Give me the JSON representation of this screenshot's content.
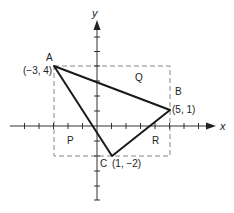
{
  "diagram": {
    "axes": {
      "x_label": "x",
      "y_label": "y",
      "unit_px": 14.5,
      "origin_px": [
        97,
        126
      ]
    },
    "points": [
      {
        "name": "A",
        "coord_label": "(−3, 4)",
        "x": -3,
        "y": 4
      },
      {
        "name": "B",
        "coord_label": "(5, 1)",
        "x": 5,
        "y": 1
      },
      {
        "name": "C",
        "coord_label": "(1, −2)",
        "x": 1,
        "y": -2
      }
    ],
    "regions": [
      {
        "name": "P"
      },
      {
        "name": "Q"
      },
      {
        "name": "R"
      }
    ],
    "bounding_rectangle": {
      "x_min": -3,
      "x_max": 5,
      "y_min": -2,
      "y_max": 4,
      "style": "dashed"
    },
    "colors": {
      "line": "#1a1a1a",
      "dashed": "#888888",
      "axis": "#333333"
    }
  }
}
